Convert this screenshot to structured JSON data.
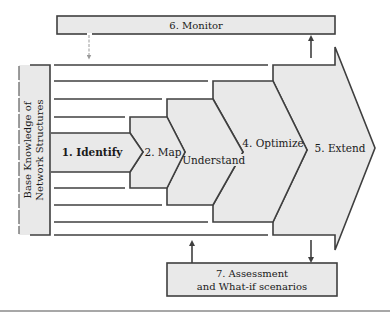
{
  "diagram": {
    "monitor": {
      "label": "6. Monitor"
    },
    "base_knowledge": {
      "line1": "Base Knowledge of",
      "line2": "Network Structures"
    },
    "steps": [
      {
        "id": "identify",
        "label": "1. Identify"
      },
      {
        "id": "map",
        "label": "2. Map"
      },
      {
        "id": "understand",
        "label": "3. Understand"
      },
      {
        "id": "optimize",
        "label": "4. Optimize"
      },
      {
        "id": "extend",
        "label": "5. Extend"
      }
    ],
    "assessment": {
      "line1": "7. Assessment",
      "line2": "and What-if scenarios"
    },
    "colors": {
      "fill": "#e9e9e9",
      "stroke": "#3f3f3f",
      "separator": "#8a8a8a"
    }
  }
}
